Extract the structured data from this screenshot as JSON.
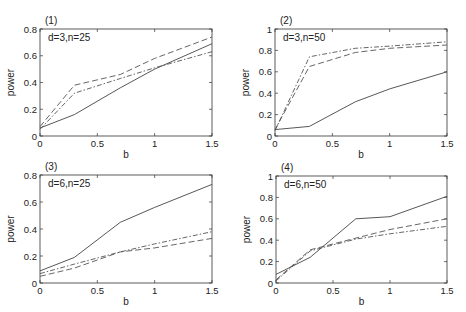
{
  "chart_data": [
    {
      "type": "line",
      "panel_label": "(1)",
      "annotation": "d=3,n=25",
      "xlabel": "b",
      "ylabel": "power",
      "xlim": [
        0,
        1.5
      ],
      "ylim": [
        0,
        0.8
      ],
      "xticks": [
        "0",
        "0.5",
        "1",
        "1.5"
      ],
      "yticks": [
        "0",
        "0.2",
        "0.4",
        "0.6",
        "0.8"
      ],
      "grid": false,
      "x": [
        0,
        0.3,
        0.7,
        1.0,
        1.5
      ],
      "series": [
        {
          "name": "solid",
          "style": "solid",
          "values": [
            0.06,
            0.16,
            0.36,
            0.5,
            0.69
          ]
        },
        {
          "name": "dashed",
          "style": "dashed",
          "values": [
            0.07,
            0.38,
            0.46,
            0.58,
            0.74
          ]
        },
        {
          "name": "dash-dot",
          "style": "dashdot",
          "values": [
            0.05,
            0.32,
            0.43,
            0.51,
            0.63
          ]
        }
      ]
    },
    {
      "type": "line",
      "panel_label": "(2)",
      "annotation": "d=3,n=50",
      "xlabel": "b",
      "ylabel": "power",
      "xlim": [
        0,
        1.5
      ],
      "ylim": [
        0,
        1
      ],
      "xticks": [
        "0",
        "0.5",
        "1",
        "1.5"
      ],
      "yticks": [
        "0",
        "0.2",
        "0.4",
        "0.6",
        "0.8",
        "1"
      ],
      "grid": false,
      "x": [
        0,
        0.3,
        0.7,
        1.0,
        1.5
      ],
      "series": [
        {
          "name": "solid",
          "style": "solid",
          "values": [
            0.06,
            0.09,
            0.32,
            0.44,
            0.6
          ]
        },
        {
          "name": "dashed",
          "style": "dashed",
          "values": [
            0.06,
            0.65,
            0.78,
            0.82,
            0.85
          ]
        },
        {
          "name": "dash-dot",
          "style": "dashdot",
          "values": [
            0.05,
            0.74,
            0.82,
            0.84,
            0.88
          ]
        }
      ]
    },
    {
      "type": "line",
      "panel_label": "(3)",
      "annotation": "d=6,n=25",
      "xlabel": "b",
      "ylabel": "power",
      "xlim": [
        0,
        1.5
      ],
      "ylim": [
        0,
        0.8
      ],
      "xticks": [
        "0",
        "0.5",
        "1",
        "1.5"
      ],
      "yticks": [
        "0",
        "0.2",
        "0.4",
        "0.6",
        "0.8"
      ],
      "grid": false,
      "x": [
        0,
        0.3,
        0.7,
        1.0,
        1.5
      ],
      "series": [
        {
          "name": "solid",
          "style": "solid",
          "values": [
            0.09,
            0.19,
            0.45,
            0.56,
            0.73
          ]
        },
        {
          "name": "dashed",
          "style": "dashed",
          "values": [
            0.05,
            0.11,
            0.23,
            0.26,
            0.33
          ]
        },
        {
          "name": "dash-dot",
          "style": "dashdot",
          "values": [
            0.07,
            0.14,
            0.23,
            0.29,
            0.38
          ]
        }
      ]
    },
    {
      "type": "line",
      "panel_label": "(4)",
      "annotation": "d=6,n=50",
      "xlabel": "b",
      "ylabel": "power",
      "xlim": [
        0,
        1.5
      ],
      "ylim": [
        0,
        1
      ],
      "xticks": [
        "0",
        "0.5",
        "1",
        "1.5"
      ],
      "yticks": [
        "0",
        "0.2",
        "0.4",
        "0.6",
        "0.8",
        "1"
      ],
      "grid": false,
      "x": [
        0,
        0.3,
        0.7,
        1.0,
        1.5
      ],
      "series": [
        {
          "name": "solid",
          "style": "solid",
          "values": [
            0.08,
            0.24,
            0.6,
            0.62,
            0.81
          ]
        },
        {
          "name": "dashed",
          "style": "dashed",
          "values": [
            0.03,
            0.31,
            0.42,
            0.5,
            0.6
          ]
        },
        {
          "name": "dash-dot",
          "style": "dashdot",
          "values": [
            0.02,
            0.3,
            0.41,
            0.46,
            0.53
          ]
        }
      ]
    }
  ],
  "layout": {
    "panels": [
      {
        "left": 40,
        "top": 29,
        "right": 212,
        "bottom": 136
      },
      {
        "left": 275,
        "top": 29,
        "right": 447,
        "bottom": 136
      },
      {
        "left": 40,
        "top": 175,
        "right": 212,
        "bottom": 283
      },
      {
        "left": 276,
        "top": 176,
        "right": 447,
        "bottom": 283
      }
    ]
  }
}
